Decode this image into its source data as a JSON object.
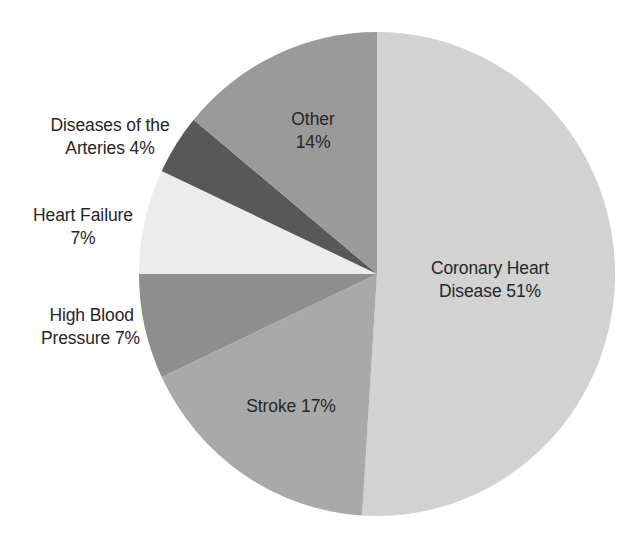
{
  "chart_data": {
    "type": "pie",
    "title": "",
    "start_angle_deg": 0,
    "direction": "clockwise",
    "slices": [
      {
        "name": "Coronary Heart Disease",
        "value": 51,
        "color": "#d2d2d2"
      },
      {
        "name": "Stroke",
        "value": 17,
        "color": "#a9a9a9"
      },
      {
        "name": "High Blood Pressure",
        "value": 7,
        "color": "#8e8e8e"
      },
      {
        "name": "Heart Failure",
        "value": 7,
        "color": "#ececec"
      },
      {
        "name": "Diseases of the Arteries",
        "value": 4,
        "color": "#585858"
      },
      {
        "name": "Other",
        "value": 14,
        "color": "#9a9a9a"
      }
    ],
    "categories": [
      "Coronary Heart Disease",
      "Stroke",
      "High Blood Pressure",
      "Heart Failure",
      "Diseases of the Arteries",
      "Other"
    ],
    "values": [
      51,
      17,
      7,
      7,
      4,
      14
    ],
    "unit": "%",
    "legend": "none (direct labels)"
  },
  "labels": {
    "coronary": {
      "line1": "Coronary Heart",
      "line2": "Disease 51%"
    },
    "stroke": {
      "line1": "Stroke 17%"
    },
    "high_blood_pressure": {
      "line1": "High Blood",
      "line2": "Pressure 7%"
    },
    "heart_failure": {
      "line1": "Heart Failure",
      "line2": "7%"
    },
    "arteries": {
      "line1": "Diseases of the",
      "line2": "Arteries 4%"
    },
    "other": {
      "line1": "Other",
      "line2": "14%"
    }
  }
}
